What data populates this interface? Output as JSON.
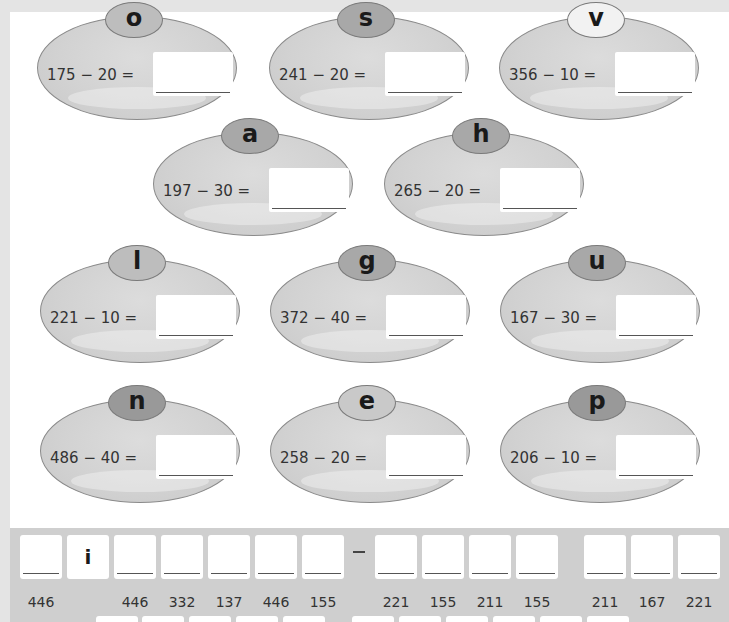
{
  "puzzles": [
    {
      "letter": "o",
      "sum": "175 − 20 =",
      "answer": ""
    },
    {
      "letter": "s",
      "sum": "241 − 20 =",
      "answer": ""
    },
    {
      "letter": "v",
      "sum": "356 − 10 =",
      "answer": ""
    },
    {
      "letter": "a",
      "sum": "197 − 30 =",
      "answer": ""
    },
    {
      "letter": "h",
      "sum": "265 − 20 =",
      "answer": ""
    },
    {
      "letter": "l",
      "sum": "221 − 10 =",
      "answer": ""
    },
    {
      "letter": "g",
      "sum": "372 − 40 =",
      "answer": ""
    },
    {
      "letter": "u",
      "sum": "167 − 30 =",
      "answer": ""
    },
    {
      "letter": "n",
      "sum": "486 − 40 =",
      "answer": ""
    },
    {
      "letter": "e",
      "sum": "258 − 20 =",
      "answer": ""
    },
    {
      "letter": "p",
      "sum": "206 − 10 =",
      "answer": ""
    }
  ],
  "code_row_1": {
    "cells": [
      {
        "letter": "",
        "code": "446"
      },
      {
        "letter": "i",
        "code": ""
      },
      {
        "letter": "",
        "code": "446"
      },
      {
        "letter": "",
        "code": "332"
      },
      {
        "letter": "",
        "code": "137"
      },
      {
        "letter": "",
        "code": "446"
      },
      {
        "letter": "",
        "code": "155"
      },
      {
        "letter": "",
        "code": "221"
      },
      {
        "letter": "",
        "code": "155"
      },
      {
        "letter": "",
        "code": "211"
      },
      {
        "letter": "",
        "code": "155"
      },
      {
        "letter": "",
        "code": "211"
      },
      {
        "letter": "",
        "code": "167"
      },
      {
        "letter": "",
        "code": "221"
      }
    ],
    "separator": "–"
  }
}
